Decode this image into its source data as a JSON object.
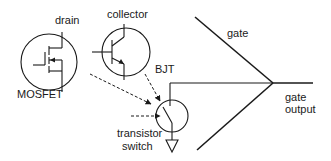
{
  "labels": {
    "drain": "drain",
    "mosfet": "MOSFET",
    "collector": "collector",
    "bjt": "BJT",
    "transistor_switch_line1": "transistor",
    "transistor_switch_line2": "switch",
    "gate": "gate",
    "gate_output_line1": "gate",
    "gate_output_line2": "output"
  },
  "colors": {
    "line": "#1a1a1a",
    "background": "#ffffff"
  }
}
